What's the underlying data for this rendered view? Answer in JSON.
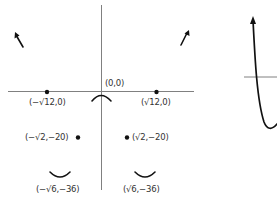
{
  "colors": {
    "axis": "#808080",
    "ink": "#111111",
    "label": "#333333",
    "background": "#ffffff"
  },
  "left_graph": {
    "origin_label": "(0,0)",
    "points": [
      {
        "label": "(−√12,0)",
        "kind": "x-intercept"
      },
      {
        "label": "(√12,0)",
        "kind": "x-intercept"
      },
      {
        "label": "(−√2,−20)",
        "kind": "inflection-point"
      },
      {
        "label": "(√2,−20)",
        "kind": "inflection-point"
      },
      {
        "label": "(−√6,−36)",
        "kind": "local-minimum"
      },
      {
        "label": "(√6,−36)",
        "kind": "local-minimum"
      }
    ],
    "end_behavior": [
      "up-left",
      "up-right"
    ]
  },
  "right_graph": {
    "description": "partial curve crossing horizontal axis, arrow pointing up"
  }
}
